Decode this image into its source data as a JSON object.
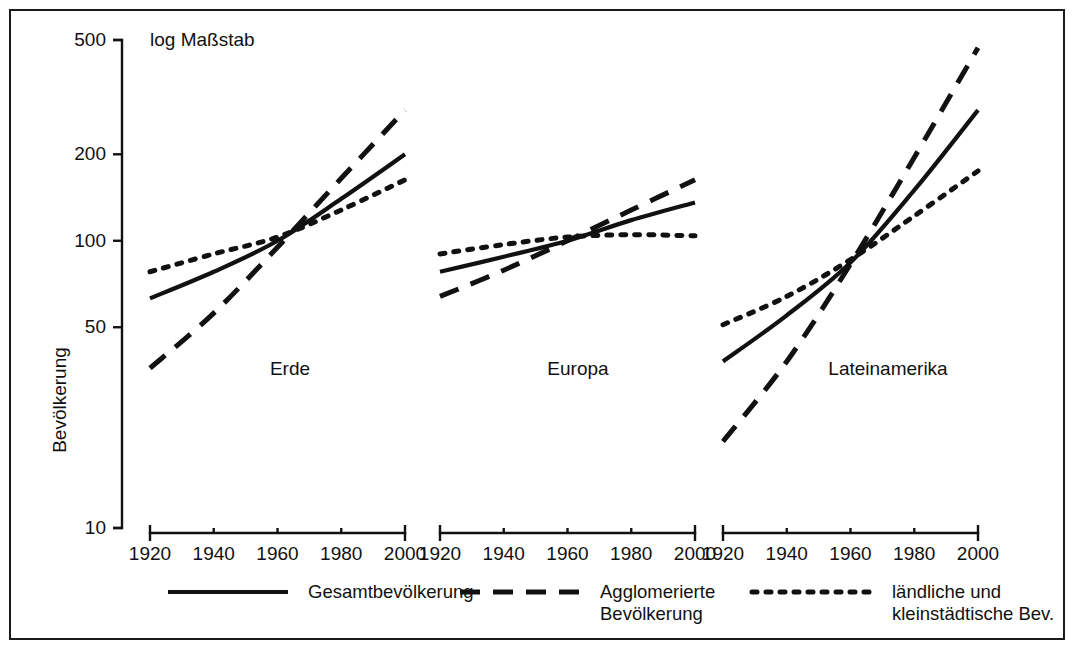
{
  "note": "log Maßstab",
  "chart_data": {
    "type": "line",
    "title": "",
    "subtitle": "log Maßstab",
    "xlabel": "",
    "ylabel": "Bevölkerung",
    "yscale": "log",
    "ylim": [
      10,
      500
    ],
    "yticks": [
      500,
      200,
      100,
      50,
      10
    ],
    "ytick_labels": [
      "500",
      "200",
      "100",
      "50",
      "10"
    ],
    "xlim": [
      1920,
      2000
    ],
    "xticks": [
      1920,
      1940,
      1960,
      1980,
      2000
    ],
    "xtick_labels": [
      "1920",
      "1940",
      "1960",
      "1980",
      "2000"
    ],
    "grid": false,
    "legend_position": "bottom",
    "x": [
      1920,
      1940,
      1960,
      1980,
      2000
    ],
    "panels": [
      {
        "label": "Erde",
        "series": [
          {
            "name": "Gesamtbevölkerung",
            "style": "solid",
            "values": [
              63,
              78,
              100,
              140,
              200
            ]
          },
          {
            "name": "Agglomerierte Bevölkerung",
            "style": "dashed",
            "values": [
              36,
              56,
              95,
              165,
              285
            ]
          },
          {
            "name": "ländliche und kleinstädtische Bev.",
            "style": "dotted",
            "values": [
              78,
              90,
              103,
              128,
              163
            ]
          }
        ]
      },
      {
        "label": "Europa",
        "series": [
          {
            "name": "Gesamtbevölkerung",
            "style": "solid",
            "values": [
              78,
              88,
              100,
              118,
              136
            ]
          },
          {
            "name": "Agglomerierte Bevölkerung",
            "style": "dashed",
            "values": [
              64,
              79,
              100,
              128,
              163
            ]
          },
          {
            "name": "ländliche und kleinstädtische Bev.",
            "style": "dotted",
            "values": [
              90,
              97,
              103,
              105,
              104
            ]
          }
        ]
      },
      {
        "label": "Lateinamerika",
        "series": [
          {
            "name": "Gesamtbevölkerung",
            "style": "solid",
            "values": [
              38,
              55,
              84,
              150,
              285
            ]
          },
          {
            "name": "Agglomerierte Bevölkerung",
            "style": "dashed",
            "values": [
              20,
              38,
              83,
              195,
              470
            ]
          },
          {
            "name": "ländliche und kleinstädtische Bev.",
            "style": "dotted",
            "values": [
              51,
              64,
              86,
              122,
              175
            ]
          }
        ]
      }
    ],
    "legend": [
      {
        "label": "Gesamtbevölkerung",
        "style": "solid"
      },
      {
        "label": "Agglomerierte Bevölkerung",
        "style": "dashed"
      },
      {
        "label": "ländliche und kleinstädtische Bev.",
        "style": "dotted"
      }
    ]
  }
}
